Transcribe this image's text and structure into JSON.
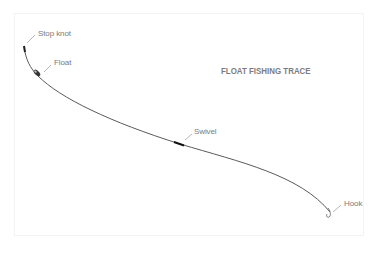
{
  "diagram": {
    "title": "FLOAT FISHING TRACE",
    "colors": {
      "line": "#5a5a5a",
      "leader": "#9a9a9a",
      "text": "#7a7a7a",
      "frame": "#f3f3f3"
    },
    "labels": {
      "stop_knot": "Stop knot",
      "float": "Float",
      "swivel": "Swivel",
      "hook": "Hook"
    }
  }
}
